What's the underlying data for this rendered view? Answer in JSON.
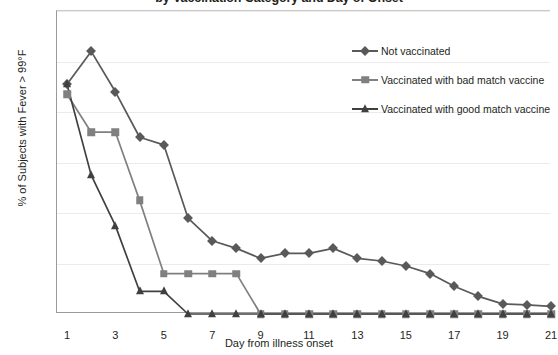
{
  "chart_data": {
    "type": "line",
    "title": "by Vaccination Category and Day of Onset",
    "xlabel": "Day from illness onset",
    "ylabel": "% of Subjects with Fever > 99°F",
    "ylim": [
      0,
      60
    ],
    "xlim": [
      1,
      21
    ],
    "ytick_labels": [
      "0%",
      "10%",
      "20%",
      "30%",
      "40%",
      "50%",
      "60%"
    ],
    "ytick_values": [
      0,
      10,
      20,
      30,
      40,
      50,
      60
    ],
    "xtick_labels": [
      "1",
      "3",
      "5",
      "7",
      "9",
      "11",
      "13",
      "15",
      "17",
      "19",
      "21"
    ],
    "xtick_values": [
      1,
      3,
      5,
      7,
      9,
      11,
      13,
      15,
      17,
      19,
      21
    ],
    "grid": true,
    "legend_position": "upper right",
    "x": [
      1,
      2,
      3,
      4,
      5,
      6,
      7,
      8,
      9,
      10,
      11,
      12,
      13,
      14,
      15,
      16,
      17,
      18,
      19,
      20,
      21
    ],
    "series": [
      {
        "name": "Not vaccinated",
        "marker": "diamond",
        "color": "#595959",
        "values": [
          45.5,
          52.0,
          44.0,
          35.0,
          33.5,
          19.0,
          14.5,
          13.0,
          11.0,
          12.0,
          12.0,
          13.0,
          11.0,
          10.5,
          9.5,
          8.0,
          5.5,
          3.5,
          2.0,
          1.8,
          1.5
        ]
      },
      {
        "name": "Vaccinated with bad match vaccine",
        "marker": "square",
        "color": "#808080",
        "values": [
          43.5,
          36.0,
          36.0,
          22.5,
          8.0,
          8.0,
          8.0,
          8.0,
          0.0,
          0.0,
          0.0,
          0.0,
          0.0,
          0.0,
          0.0,
          0.0,
          0.0,
          0.0,
          0.0,
          0.0,
          0.0
        ]
      },
      {
        "name": "Vaccinated with good match vaccine",
        "marker": "triangle",
        "color": "#404040",
        "values": [
          45.5,
          27.5,
          17.5,
          4.5,
          4.5,
          0.0,
          0.0,
          0.0,
          0.0,
          0.0,
          0.0,
          0.0,
          0.0,
          0.0,
          0.0,
          0.0,
          0.0,
          0.0,
          0.0,
          0.0,
          0.0
        ]
      }
    ]
  }
}
